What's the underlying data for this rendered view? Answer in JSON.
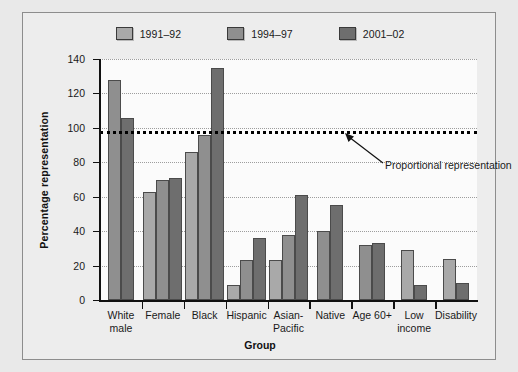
{
  "chart_data": {
    "type": "bar",
    "title": "",
    "xlabel": "Group",
    "ylabel": "Percentage representation",
    "ylim": [
      0,
      140
    ],
    "yticks": [
      0,
      20,
      40,
      60,
      80,
      100,
      120,
      140
    ],
    "grid": true,
    "legend_position": "top-center",
    "categories": [
      "White\nmale",
      "Female",
      "Black",
      "Hispanic",
      "Asian-\nPacific",
      "Native",
      "Age 60+",
      "Low\nincome",
      "Disability"
    ],
    "series": [
      {
        "name": "1991–92",
        "color": "#a9a9a9",
        "values": [
          null,
          63,
          86,
          9,
          23,
          null,
          null,
          29,
          24
        ]
      },
      {
        "name": "1994–97",
        "color": "#8f8f8f",
        "values": [
          128,
          70,
          96,
          23,
          38,
          40,
          32,
          null,
          null
        ]
      },
      {
        "name": "2001–02",
        "color": "#6e6e6e",
        "values": [
          106,
          71,
          135,
          36,
          61,
          55,
          33,
          9,
          10
        ]
      }
    ],
    "reference_line": {
      "value": 98,
      "label": "Proportional representation",
      "style": "dotted"
    }
  },
  "legend": {
    "items": [
      {
        "label": "1991–92",
        "swatch": "#a9a9a9"
      },
      {
        "label": "1994–97",
        "swatch": "#8f8f8f"
      },
      {
        "label": "2001–02",
        "swatch": "#6e6e6e"
      }
    ]
  },
  "axes": {
    "y_title": "Percentage representation",
    "x_title": "Group",
    "y_tick_labels": [
      "140",
      "120",
      "100",
      "80",
      "60",
      "40",
      "20",
      "0"
    ]
  },
  "annotation": {
    "text": "Proportional representation"
  }
}
